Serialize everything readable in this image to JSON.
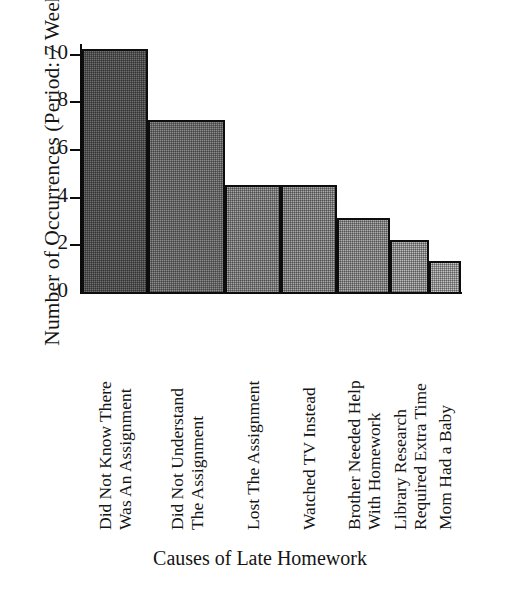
{
  "chart_data": {
    "type": "bar",
    "title": "",
    "xlabel": "Causes of Late Homework",
    "ylabel": "Number of Occurrences (Period: 7 Weeks)",
    "categories": [
      "Did Not Know There Was An Assignment",
      "Did Not Understand The Assignment",
      "Lost The Assignment",
      "Watched TV Instead",
      "Brother Needed Help With Homework",
      "Library Research Required Extra Time",
      "Mom Had a Baby"
    ],
    "category_lines": [
      [
        "Did Not Know There",
        "Was An Assignment"
      ],
      [
        "Did Not Understand",
        "The Assignment"
      ],
      [
        "Lost The Assignment"
      ],
      [
        "Watched TV Instead"
      ],
      [
        "Brother Needed Help",
        "With Homework"
      ],
      [
        "Library Research",
        "Required Extra Time"
      ],
      [
        "Mom Had a Baby"
      ]
    ],
    "values": [
      10.2,
      7.2,
      4.5,
      4.5,
      3.1,
      2.2,
      1.3
    ],
    "bar_fills": [
      "#6d6d6d",
      "#8c8c8c",
      "#a5a5a5",
      "#a9a9a9",
      "#b0b0b0",
      "#bdbdbd",
      "#c6c6c6"
    ],
    "bar_widths": [
      66,
      77,
      56,
      56,
      53,
      39,
      32
    ],
    "ylim": [
      0,
      10.2
    ],
    "yticks": [
      0,
      2,
      4,
      6,
      8,
      10
    ],
    "ytick_labels": [
      "0",
      "2",
      "4",
      "6",
      "8",
      "10"
    ],
    "grid": false,
    "legend": "none",
    "outline_color": "#0d0d0d",
    "background_color": "#ffffff"
  }
}
